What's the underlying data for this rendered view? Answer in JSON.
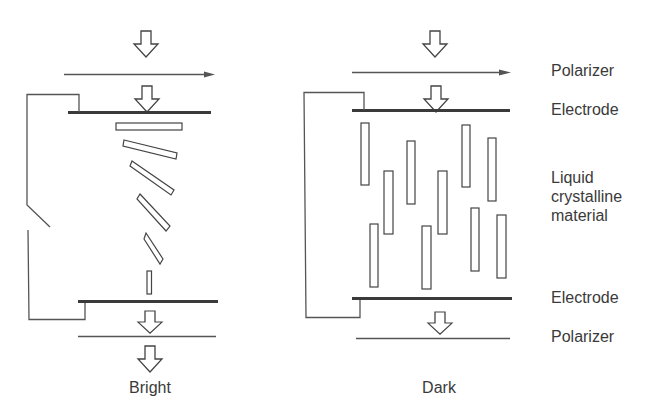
{
  "diagram": {
    "colors": {
      "line": "#444444",
      "electrode": "#3a3a3a",
      "background": "#ffffff"
    },
    "labels": {
      "top_polarizer": "Polarizer",
      "top_electrode": "Electrode",
      "liquid_crystal": "Liquid\ncrystalline\nmaterial",
      "bottom_electrode": "Electrode",
      "bottom_polarizer": "Polarizer"
    },
    "panels": [
      {
        "id": "left",
        "state": "switch open (no field)",
        "caption": "Bright",
        "molecule_arrangement": "twisted helix"
      },
      {
        "id": "right",
        "state": "switch closed (field applied)",
        "caption": "Dark",
        "molecule_arrangement": "aligned vertically"
      }
    ],
    "icons": [
      "light-arrow-icon",
      "switch-icon"
    ]
  }
}
